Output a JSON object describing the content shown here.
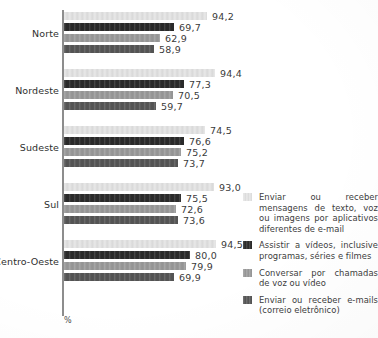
{
  "chart_data": {
    "type": "bar",
    "orientation": "horizontal",
    "title": "",
    "xlabel": "%",
    "ylabel": "",
    "categories": [
      "Norte",
      "Nordeste",
      "Sudeste",
      "Sul",
      "Centro-Oeste"
    ],
    "series": [
      {
        "name": "Enviar ou receber mensagens de texto, voz ou imagens por aplicativos diferentes de e-mail",
        "color": "#e3e3e3",
        "values": [
          94.2,
          94.4,
          74.5,
          93.0,
          94.5
        ],
        "labels": [
          "94,2",
          "94,4",
          "74,5",
          "93,0",
          "94,5"
        ],
        "bar_px": [
          143,
          151,
          141,
          150,
          152
        ]
      },
      {
        "name": "Assistir a vídeos, inclusive programas, séries e filmes",
        "color": "#2b2b2b",
        "values": [
          69.7,
          77.3,
          76.6,
          75.5,
          80.0
        ],
        "labels": [
          "69,7",
          "77,3",
          "76,6",
          "75,5",
          "80,0"
        ],
        "bar_px": [
          110,
          120,
          120,
          117,
          126
        ]
      },
      {
        "name": "Conversar por chamadas de voz ou vídeo",
        "color": "#9a9a9a",
        "values": [
          62.9,
          70.5,
          75.2,
          72.6,
          79.9
        ],
        "labels": [
          "62,9",
          "70,5",
          "75,2",
          "72,6",
          "79,9"
        ],
        "bar_px": [
          96,
          109,
          117,
          112,
          122
        ]
      },
      {
        "name": "Enviar ou receber e-mails (correio eletrônico)",
        "color": "#565656",
        "values": [
          58.9,
          59.7,
          73.7,
          73.6,
          69.9
        ],
        "labels": [
          "58,9",
          "59,7",
          "73,7",
          "73,6",
          "69,9"
        ],
        "bar_px": [
          90,
          92,
          114,
          114,
          110
        ]
      }
    ],
    "legend_position": "right",
    "grid": false,
    "axis_unit": "%"
  },
  "legend": {
    "items": [
      {
        "text": "Enviar ou receber mensagens de texto, voz ou imagens por aplicativos diferentes de e-mail",
        "swatch": "s0"
      },
      {
        "text": "Assistir a vídeos, inclusive programas, séries e filmes",
        "swatch": "s1"
      },
      {
        "text": "Conversar por chamadas de voz ou vídeo",
        "swatch": "s2"
      },
      {
        "text": "Enviar ou receber e-mails (correio eletrônico)",
        "swatch": "s3"
      }
    ]
  },
  "axis": {
    "unit_label": "%"
  },
  "colors": {
    "series_1": "#e3e3e3",
    "series_2": "#2b2b2b",
    "series_3": "#9a9a9a",
    "series_4": "#565656",
    "axis": "#8d8d8d",
    "text": "#2f2f2f",
    "background": "#ffffff"
  }
}
